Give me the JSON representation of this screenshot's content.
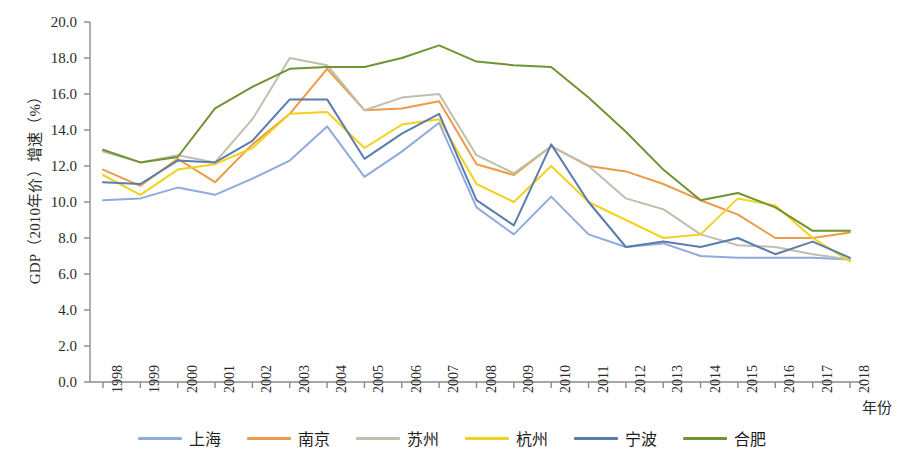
{
  "chart_data": {
    "type": "line",
    "title": "",
    "xlabel": "年份",
    "ylabel": "GDP（2010年价）增速（%）",
    "xlim": [
      1998,
      2018
    ],
    "ylim": [
      0.0,
      20.0
    ],
    "ytick_step": 2.0,
    "grid": false,
    "legend_position": "bottom",
    "x": [
      1998,
      1999,
      2000,
      2001,
      2002,
      2003,
      2004,
      2005,
      2006,
      2007,
      2008,
      2009,
      2010,
      2011,
      2012,
      2013,
      2014,
      2015,
      2016,
      2017,
      2018
    ],
    "categories": [
      "1998",
      "1999",
      "2000",
      "2001",
      "2002",
      "2003",
      "2004",
      "2005",
      "2006",
      "2007",
      "2008",
      "2009",
      "2010",
      "2011",
      "2012",
      "2013",
      "2014",
      "2015",
      "2016",
      "2017",
      "2018"
    ],
    "ytick_labels": [
      "0.0",
      "2.0",
      "4.0",
      "6.0",
      "8.0",
      "10.0",
      "12.0",
      "14.0",
      "16.0",
      "18.0",
      "20.0"
    ],
    "ytick_values": [
      0.0,
      2.0,
      4.0,
      6.0,
      8.0,
      10.0,
      12.0,
      14.0,
      16.0,
      18.0,
      20.0
    ],
    "series": [
      {
        "name": "上海",
        "color": "#8faadc",
        "values": [
          10.1,
          10.2,
          10.8,
          10.4,
          11.3,
          12.3,
          14.2,
          11.4,
          12.8,
          14.4,
          9.7,
          8.2,
          10.3,
          8.2,
          7.5,
          7.7,
          7.0,
          6.9,
          6.9,
          6.9,
          6.8
        ]
      },
      {
        "name": "南京",
        "color": "#ed9b46",
        "values": [
          11.8,
          10.9,
          12.4,
          11.1,
          13.2,
          14.9,
          17.4,
          15.1,
          15.2,
          15.6,
          12.1,
          11.5,
          13.1,
          12.0,
          11.7,
          11.0,
          10.1,
          9.3,
          8.0,
          8.0,
          8.3
        ]
      },
      {
        "name": "苏州",
        "color": "#bfbfb0",
        "values": [
          12.8,
          12.2,
          12.6,
          12.2,
          14.6,
          18.0,
          17.6,
          15.1,
          15.8,
          16.0,
          12.6,
          11.6,
          13.1,
          12.0,
          10.2,
          9.6,
          8.2,
          7.6,
          7.5,
          7.1,
          6.8
        ]
      },
      {
        "name": "杭州",
        "color": "#f2d21e",
        "values": [
          11.5,
          10.4,
          11.8,
          12.1,
          13.0,
          14.9,
          15.0,
          13.0,
          14.3,
          14.6,
          11.0,
          10.0,
          12.0,
          10.0,
          9.0,
          8.0,
          8.2,
          10.2,
          9.8,
          8.0,
          6.7
        ]
      },
      {
        "name": "宁波",
        "color": "#5b7dad",
        "values": [
          11.1,
          11.0,
          12.3,
          12.2,
          13.4,
          15.7,
          15.7,
          12.4,
          13.8,
          14.9,
          10.1,
          8.7,
          13.2,
          10.0,
          7.5,
          7.8,
          7.5,
          8.0,
          7.1,
          7.8,
          6.9
        ]
      },
      {
        "name": "合肥",
        "color": "#709432",
        "values": [
          12.9,
          12.2,
          12.5,
          15.2,
          16.4,
          17.4,
          17.5,
          17.5,
          18.0,
          18.7,
          17.8,
          17.6,
          17.5,
          15.8,
          13.9,
          11.8,
          10.1,
          10.5,
          9.7,
          8.4,
          8.4
        ]
      }
    ]
  },
  "legend": {
    "items": [
      {
        "label": "上海",
        "color": "#8faadc"
      },
      {
        "label": "南京",
        "color": "#ed9b46"
      },
      {
        "label": "苏州",
        "color": "#bfbfb0"
      },
      {
        "label": "杭州",
        "color": "#f2d21e"
      },
      {
        "label": "宁波",
        "color": "#5b7dad"
      },
      {
        "label": "合肥",
        "color": "#709432"
      }
    ]
  },
  "axes": {
    "axis_color": "#8a8a8a",
    "y_title": "GDP（2010年价）增速（%）",
    "x_title": "年份"
  }
}
